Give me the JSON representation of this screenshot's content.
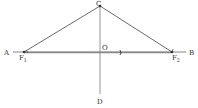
{
  "diagram": {
    "points": {
      "A": {
        "label": "A",
        "x": 8,
        "y": 52
      },
      "B": {
        "label": "B",
        "x": 190,
        "y": 52
      },
      "C": {
        "label": "C",
        "x": 100,
        "y": 6
      },
      "D": {
        "label": "D",
        "x": 100,
        "y": 102
      },
      "O": {
        "label": "O",
        "x": 100,
        "y": 52
      },
      "F1": {
        "label": "F",
        "sub": "1",
        "x": 24,
        "y": 52
      },
      "F2": {
        "label": "F",
        "sub": "2",
        "x": 172,
        "y": 52
      }
    },
    "colors": {
      "line": "#555555",
      "thick": "#888888",
      "text": "#333333"
    }
  }
}
